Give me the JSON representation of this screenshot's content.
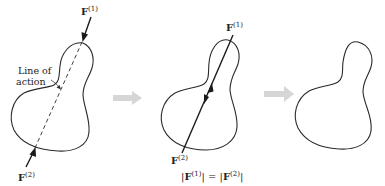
{
  "figure": {
    "panels": [
      {
        "id": "panel-1",
        "force_top": {
          "symbol": "F",
          "superscript": "(1)"
        },
        "force_bottom": {
          "symbol": "F",
          "superscript": "(2)"
        },
        "annotation_line1": "Line of",
        "annotation_line2": "action",
        "line_style": "dashed"
      },
      {
        "id": "panel-2",
        "force_top": {
          "symbol": "F",
          "superscript": "(1)"
        },
        "force_bottom": {
          "symbol": "F",
          "superscript": "(2)"
        },
        "equation": {
          "left_open": "|",
          "left_symbol": "F",
          "left_sup": "(1)",
          "left_close": "|",
          "equals": " = ",
          "right_open": "|",
          "right_symbol": "F",
          "right_sup": "(2)",
          "right_close": "|"
        },
        "line_style": "solid"
      },
      {
        "id": "panel-3",
        "line_style": "none"
      }
    ],
    "transition_arrows": 2,
    "colors": {
      "outline": "#2a2a2a",
      "transition_arrow": "#d6d6d6",
      "background": "#ffffff"
    }
  }
}
